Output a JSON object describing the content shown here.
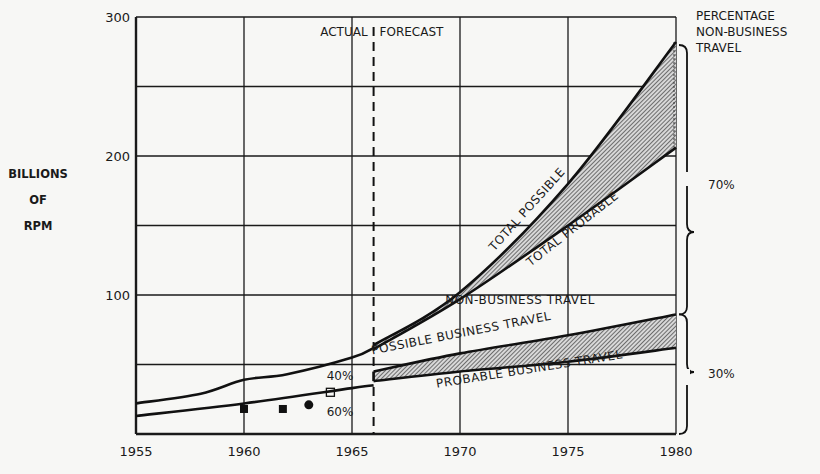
{
  "chart_data": {
    "type": "line",
    "title": "",
    "xlabel": "",
    "ylabel": "BILLIONS OF RPM",
    "ylabel_lines": [
      "BILLIONS",
      "OF",
      "RPM"
    ],
    "xlim": [
      1955,
      1980
    ],
    "ylim": [
      0,
      300
    ],
    "x_ticks": [
      1955,
      1960,
      1965,
      1970,
      1975,
      1980
    ],
    "y_ticks": [
      100,
      200,
      300
    ],
    "y_grid": [
      50,
      100,
      150,
      200,
      250,
      300
    ],
    "grid": true,
    "divider": {
      "x": 1966,
      "left_label": "ACTUAL",
      "right_label": "FORECAST"
    },
    "series": [
      {
        "name": "Total (actual)",
        "x": [
          1955,
          1958,
          1960,
          1962,
          1965,
          1966
        ],
        "values": [
          22,
          29,
          39,
          43,
          55,
          62
        ]
      },
      {
        "name": "Business (actual)",
        "x": [
          1955,
          1960,
          1965,
          1966
        ],
        "values": [
          13,
          22,
          33,
          35
        ]
      },
      {
        "name": "TOTAL POSSIBLE",
        "x": [
          1966,
          1970,
          1975,
          1980
        ],
        "values": [
          64,
          102,
          180,
          282
        ]
      },
      {
        "name": "TOTAL PROBABLE",
        "x": [
          1966,
          1970,
          1975,
          1980
        ],
        "values": [
          61,
          97,
          150,
          206
        ]
      },
      {
        "name": "POSSIBLE BUSINESS TRAVEL",
        "x": [
          1966,
          1970,
          1975,
          1980
        ],
        "values": [
          45,
          58,
          71,
          86
        ]
      },
      {
        "name": "PROBABLE BUSINESS TRAVEL",
        "x": [
          1966,
          1970,
          1975,
          1980
        ],
        "values": [
          38,
          45,
          52,
          62
        ]
      }
    ],
    "points": [
      {
        "marker": "filled-square",
        "x": 1960,
        "y": 18
      },
      {
        "marker": "filled-square",
        "x": 1961.8,
        "y": 18
      },
      {
        "marker": "filled-circle",
        "x": 1963,
        "y": 21
      },
      {
        "marker": "open-square",
        "x": 1964,
        "y": 30
      }
    ],
    "annotations": {
      "pct_nonbusiness_1965": "40%",
      "pct_business_1965": "60%",
      "region_label": "NON-BUSINESS TRAVEL",
      "right_header": [
        "PERCENTAGE",
        "NON-BUSINESS",
        "TRAVEL"
      ],
      "brace_upper": "70%",
      "brace_lower": "30%"
    }
  }
}
